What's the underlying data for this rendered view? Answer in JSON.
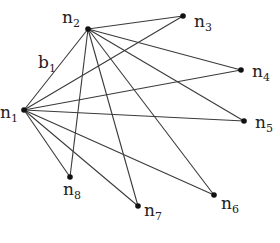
{
  "diagram": {
    "type": "graph",
    "nodes": [
      {
        "id": "n1",
        "label": "n",
        "sub": "1"
      },
      {
        "id": "n2",
        "label": "n",
        "sub": "2"
      },
      {
        "id": "n3",
        "label": "n",
        "sub": "3"
      },
      {
        "id": "n4",
        "label": "n",
        "sub": "4"
      },
      {
        "id": "n5",
        "label": "n",
        "sub": "5"
      },
      {
        "id": "n6",
        "label": "n",
        "sub": "6"
      },
      {
        "id": "n7",
        "label": "n",
        "sub": "7"
      },
      {
        "id": "n8",
        "label": "n",
        "sub": "8"
      }
    ],
    "edges": [
      {
        "from": "n1",
        "to": "n2",
        "label": "b",
        "label_sub": "1"
      },
      {
        "from": "n1",
        "to": "n3"
      },
      {
        "from": "n1",
        "to": "n4"
      },
      {
        "from": "n1",
        "to": "n5"
      },
      {
        "from": "n1",
        "to": "n6"
      },
      {
        "from": "n1",
        "to": "n7"
      },
      {
        "from": "n1",
        "to": "n8"
      },
      {
        "from": "n2",
        "to": "n3"
      },
      {
        "from": "n2",
        "to": "n4"
      },
      {
        "from": "n2",
        "to": "n5"
      },
      {
        "from": "n2",
        "to": "n6"
      },
      {
        "from": "n2",
        "to": "n7"
      },
      {
        "from": "n2",
        "to": "n8"
      }
    ]
  }
}
